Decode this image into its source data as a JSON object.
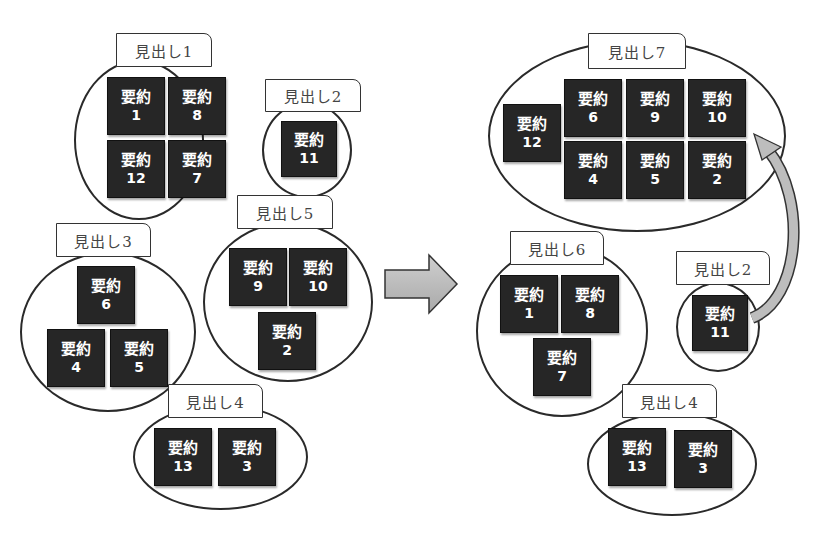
{
  "card_word": "要約",
  "left": {
    "groups": [
      {
        "id": "g1",
        "heading": "見出し1",
        "cards": [
          "1",
          "8",
          "12",
          "7"
        ]
      },
      {
        "id": "g2",
        "heading": "見出し2",
        "cards": [
          "11"
        ]
      },
      {
        "id": "g3",
        "heading": "見出し3",
        "cards": [
          "6",
          "4",
          "5"
        ]
      },
      {
        "id": "g5",
        "heading": "見出し5",
        "cards": [
          "9",
          "10",
          "2"
        ]
      },
      {
        "id": "g4",
        "heading": "見出し4",
        "cards": [
          "13",
          "3"
        ]
      }
    ]
  },
  "transition_arrow": "right-arrow",
  "right": {
    "groups": [
      {
        "id": "g7",
        "heading": "見出し7",
        "cards": [
          "12",
          "6",
          "9",
          "10",
          "4",
          "5",
          "2"
        ]
      },
      {
        "id": "g6",
        "heading": "見出し6",
        "cards": [
          "1",
          "8",
          "7"
        ]
      },
      {
        "id": "g2r",
        "heading": "見出し2",
        "cards": [
          "11"
        ]
      },
      {
        "id": "g4r",
        "heading": "見出し4",
        "cards": [
          "13",
          "3"
        ]
      }
    ],
    "move_arrow": {
      "from": "見出し2 / 要約11",
      "to": "見出し7"
    }
  },
  "colors": {
    "card": "#262626",
    "card_text": "#ffffff",
    "outline": "#2a2a2a",
    "arrow": "#bdbdbd"
  }
}
